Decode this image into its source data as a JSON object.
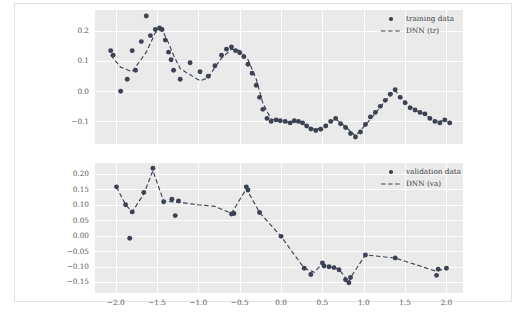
{
  "figure": {
    "background_color": "#ffffff",
    "panel_background_color": "#eaeaea",
    "grid_color": "#ffffff",
    "marker_color": "#3b4252",
    "line_color": "#3b4252"
  },
  "chart_data": [
    {
      "type": "scatter",
      "panel": "top",
      "title": "",
      "xlabel": "",
      "ylabel": "",
      "xlim": [
        -2.25,
        2.2
      ],
      "ylim": [
        -0.175,
        0.27
      ],
      "xticks": [
        -2.0,
        -1.5,
        -1.0,
        -0.5,
        0.0,
        0.5,
        1.0,
        1.5,
        2.0
      ],
      "xticklabels": [
        "-2.0",
        "-1.5",
        "-1.0",
        "-0.5",
        "0.0",
        "0.5",
        "1.0",
        "1.5",
        "2.0"
      ],
      "yticks": [
        -0.1,
        0.0,
        0.1,
        0.2
      ],
      "yticklabels": [
        "−0.1",
        "0.0",
        "0.1",
        "0.2"
      ],
      "grid": true,
      "legend_position": "upper right",
      "legend": [
        {
          "label": "training data",
          "kind": "marker"
        },
        {
          "label": "DNN (tr)",
          "kind": "dashed-line"
        }
      ],
      "series": [
        {
          "name": "training data",
          "kind": "scatter",
          "x": [
            -2.06,
            -2.03,
            -1.94,
            -1.86,
            -1.8,
            -1.76,
            -1.69,
            -1.63,
            -1.58,
            -1.52,
            -1.47,
            -1.44,
            -1.4,
            -1.36,
            -1.33,
            -1.3,
            -1.22,
            -1.1,
            -0.98,
            -0.88,
            -0.8,
            -0.72,
            -0.66,
            -0.6,
            -0.55,
            -0.5,
            -0.45,
            -0.4,
            -0.35,
            -0.3,
            -0.26,
            -0.22,
            -0.17,
            -0.12,
            -0.06,
            -0.01,
            0.05,
            0.11,
            0.16,
            0.21,
            0.26,
            0.31,
            0.36,
            0.42,
            0.48,
            0.54,
            0.6,
            0.66,
            0.72,
            0.78,
            0.84,
            0.9,
            0.96,
            1.02,
            1.08,
            1.14,
            1.2,
            1.26,
            1.32,
            1.38,
            1.44,
            1.5,
            1.56,
            1.62,
            1.68,
            1.74,
            1.8,
            1.86,
            1.92,
            1.98,
            2.04
          ],
          "y": [
            0.135,
            0.12,
            0.0,
            0.04,
            0.135,
            0.07,
            0.165,
            0.25,
            0.185,
            0.205,
            0.21,
            0.205,
            0.17,
            0.13,
            0.105,
            0.07,
            0.04,
            0.095,
            0.065,
            0.05,
            0.085,
            0.12,
            0.14,
            0.147,
            0.135,
            0.128,
            0.115,
            0.09,
            0.06,
            0.02,
            -0.02,
            -0.06,
            -0.09,
            -0.1,
            -0.095,
            -0.098,
            -0.1,
            -0.105,
            -0.098,
            -0.1,
            -0.105,
            -0.115,
            -0.125,
            -0.13,
            -0.126,
            -0.115,
            -0.1,
            -0.09,
            -0.108,
            -0.12,
            -0.14,
            -0.152,
            -0.135,
            -0.11,
            -0.085,
            -0.07,
            -0.05,
            -0.03,
            -0.01,
            0.005,
            -0.02,
            -0.038,
            -0.055,
            -0.062,
            -0.07,
            -0.075,
            -0.09,
            -0.1,
            -0.105,
            -0.095,
            -0.105
          ]
        },
        {
          "name": "DNN (tr)",
          "kind": "dashed-line",
          "x": [
            -2.06,
            -1.94,
            -1.8,
            -1.63,
            -1.52,
            -1.44,
            -1.36,
            -1.3,
            -1.22,
            -1.1,
            -0.98,
            -0.88,
            -0.8,
            -0.72,
            -0.6,
            -0.5,
            -0.4,
            -0.3,
            -0.22,
            -0.12,
            -0.01,
            0.11,
            0.21,
            0.31,
            0.42,
            0.54,
            0.66,
            0.78,
            0.9,
            1.02,
            1.14,
            1.26,
            1.38,
            1.5,
            1.62,
            1.74,
            1.86,
            1.98,
            2.04
          ],
          "y": [
            0.12,
            0.08,
            0.065,
            0.13,
            0.195,
            0.205,
            0.16,
            0.12,
            0.075,
            0.055,
            0.035,
            0.045,
            0.08,
            0.11,
            0.14,
            0.135,
            0.105,
            0.04,
            -0.04,
            -0.092,
            -0.098,
            -0.104,
            -0.099,
            -0.116,
            -0.128,
            -0.113,
            -0.092,
            -0.118,
            -0.148,
            -0.112,
            -0.073,
            -0.032,
            0.002,
            -0.036,
            -0.062,
            -0.078,
            -0.098,
            -0.098,
            -0.104
          ]
        }
      ]
    },
    {
      "type": "scatter",
      "panel": "bottom",
      "title": "",
      "xlabel": "",
      "ylabel": "",
      "xlim": [
        -2.25,
        2.2
      ],
      "ylim": [
        -0.185,
        0.235
      ],
      "xticks": [
        -2.0,
        -1.5,
        -1.0,
        -0.5,
        0.0,
        0.5,
        1.0,
        1.5,
        2.0
      ],
      "xticklabels": [
        "−2.0",
        "−1.5",
        "−1.0",
        "−0.5",
        "0.0",
        "0.5",
        "1.0",
        "1.5",
        "2.0"
      ],
      "yticks": [
        -0.15,
        -0.1,
        -0.05,
        0.0,
        0.05,
        0.1,
        0.15,
        0.2
      ],
      "yticklabels": [
        "−0.15",
        "−0.10",
        "−0.05",
        "0.00",
        "0.05",
        "0.10",
        "0.15",
        "0.20"
      ],
      "grid": true,
      "legend_position": "upper right",
      "legend": [
        {
          "label": "validation data",
          "kind": "marker"
        },
        {
          "label": "DNN (va)",
          "kind": "dashed-line"
        }
      ],
      "series": [
        {
          "name": "validation data",
          "kind": "scatter",
          "x": [
            -1.99,
            -1.88,
            -1.83,
            -1.8,
            -1.66,
            -1.55,
            -1.42,
            -1.32,
            -1.28,
            -1.24,
            -0.6,
            -0.57,
            -0.42,
            -0.4,
            -0.26,
            0.0,
            0.28,
            0.36,
            0.5,
            0.52,
            0.58,
            0.64,
            0.7,
            0.78,
            0.82,
            0.84,
            1.02,
            1.38,
            1.88,
            1.9,
            2.0
          ],
          "y": [
            0.158,
            0.1,
            -0.008,
            0.077,
            0.14,
            0.218,
            0.11,
            0.118,
            0.065,
            0.112,
            0.07,
            0.072,
            0.158,
            0.148,
            0.075,
            -0.002,
            -0.105,
            -0.125,
            -0.088,
            -0.098,
            -0.1,
            -0.103,
            -0.11,
            -0.142,
            -0.152,
            -0.135,
            -0.062,
            -0.072,
            -0.128,
            -0.108,
            -0.105
          ]
        },
        {
          "name": "DNN (va)",
          "kind": "dashed-line",
          "x": [
            -1.99,
            -1.88,
            -1.8,
            -1.66,
            -1.55,
            -1.42,
            -1.24,
            -1.0,
            -0.8,
            -0.6,
            -0.42,
            -0.26,
            0.0,
            0.28,
            0.4,
            0.5,
            0.58,
            0.7,
            0.82,
            0.84,
            1.02,
            1.38,
            1.88,
            2.0
          ],
          "y": [
            0.158,
            0.1,
            0.077,
            0.135,
            0.21,
            0.112,
            0.108,
            0.1,
            0.095,
            0.072,
            0.152,
            0.075,
            -0.002,
            -0.105,
            -0.118,
            -0.09,
            -0.1,
            -0.108,
            -0.15,
            -0.135,
            -0.062,
            -0.072,
            -0.115,
            -0.105
          ]
        }
      ]
    }
  ]
}
